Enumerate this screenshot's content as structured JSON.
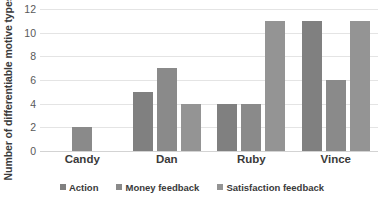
{
  "chart_data": {
    "type": "bar",
    "title": "",
    "xlabel": "",
    "ylabel": "Number of differentiable motive types",
    "categories": [
      "Candy",
      "Dan",
      "Ruby",
      "Vince"
    ],
    "series": [
      {
        "name": "Action",
        "color": "#808080",
        "values": [
          0,
          5,
          4,
          11
        ]
      },
      {
        "name": "Money feedback",
        "color": "#8a8a8a",
        "values": [
          2,
          7,
          4,
          6
        ]
      },
      {
        "name": "Satisfaction feedback",
        "color": "#949494",
        "values": [
          0,
          4,
          11,
          11
        ]
      }
    ],
    "ylim": [
      0,
      12
    ],
    "yticks": [
      0,
      2,
      4,
      6,
      8,
      10,
      12
    ],
    "ytick_labels": [
      "0",
      "2",
      "4",
      "6",
      "8",
      "10",
      "12"
    ],
    "grid": "horizontal",
    "legend_position": "bottom",
    "colors": {
      "gridline": "#e4e4e4",
      "axis": "#d3d3d3",
      "text": "#3a3a3a",
      "tick_text": "#595959",
      "background": "#ffffff"
    }
  }
}
